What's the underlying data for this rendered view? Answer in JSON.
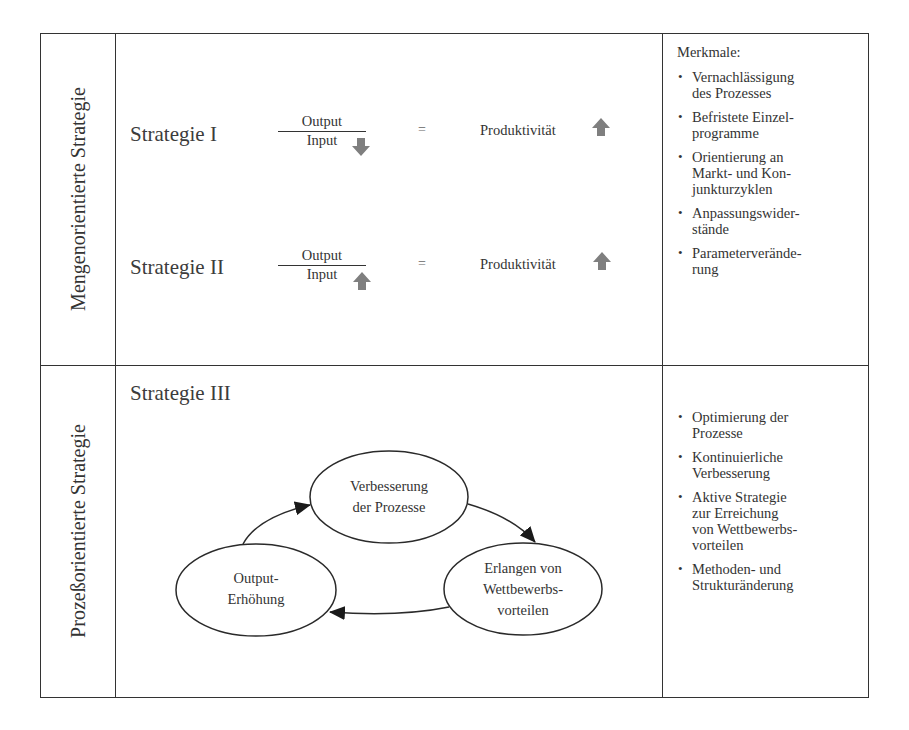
{
  "rows": [
    {
      "label": "Mengenorientierte Strategie",
      "strategies": [
        {
          "name": "Strategie I",
          "numerator": "Output",
          "denominator": "Input",
          "denominator_arrow": "arrow-down",
          "equals": "=",
          "result": "Produktivität",
          "result_arrow": "arrow-up"
        },
        {
          "name": "Strategie II",
          "numerator": "Output",
          "denominator": "Input",
          "denominator_arrow": "arrow-up",
          "equals": "=",
          "result": "Produktivität",
          "result_arrow": "arrow-up"
        }
      ],
      "features_heading": "Merkmale:",
      "features": [
        [
          "Vernachlässigung",
          "des Prozesses"
        ],
        [
          "Befristete Einzel-",
          "programme"
        ],
        [
          "Orientierung an",
          "Markt- und Kon-",
          "junkturzyklen"
        ],
        [
          "Anpassungswider-",
          "stände"
        ],
        [
          "Parameterverände-",
          "rung"
        ]
      ]
    },
    {
      "label": "Prozeßorientierte Strategie",
      "strategy_name": "Strategie III",
      "cycle": {
        "nodes": [
          {
            "id": "verbesserung",
            "lines": [
              "Verbesserung",
              "der Prozesse"
            ]
          },
          {
            "id": "erlangen",
            "lines": [
              "Erlangen von",
              "Wettbewerbs-",
              "vorteilen"
            ]
          },
          {
            "id": "output",
            "lines": [
              "Output-",
              "Erhöhung"
            ]
          }
        ],
        "edges": [
          {
            "from": "verbesserung",
            "to": "erlangen"
          },
          {
            "from": "erlangen",
            "to": "output"
          },
          {
            "from": "output",
            "to": "verbesserung"
          }
        ]
      },
      "features": [
        [
          "Optimierung der",
          "Prozesse"
        ],
        [
          "Kontinuierliche",
          "Verbesserung"
        ],
        [
          "Aktive Strategie",
          "zur Erreichung",
          "von Wettbewerbs-",
          "vorteilen"
        ],
        [
          "Methoden- und",
          "Strukturänderung"
        ]
      ]
    }
  ],
  "colors": {
    "line": "#333333",
    "text": "#333333",
    "arrow_fill": "#7f7f7f"
  }
}
